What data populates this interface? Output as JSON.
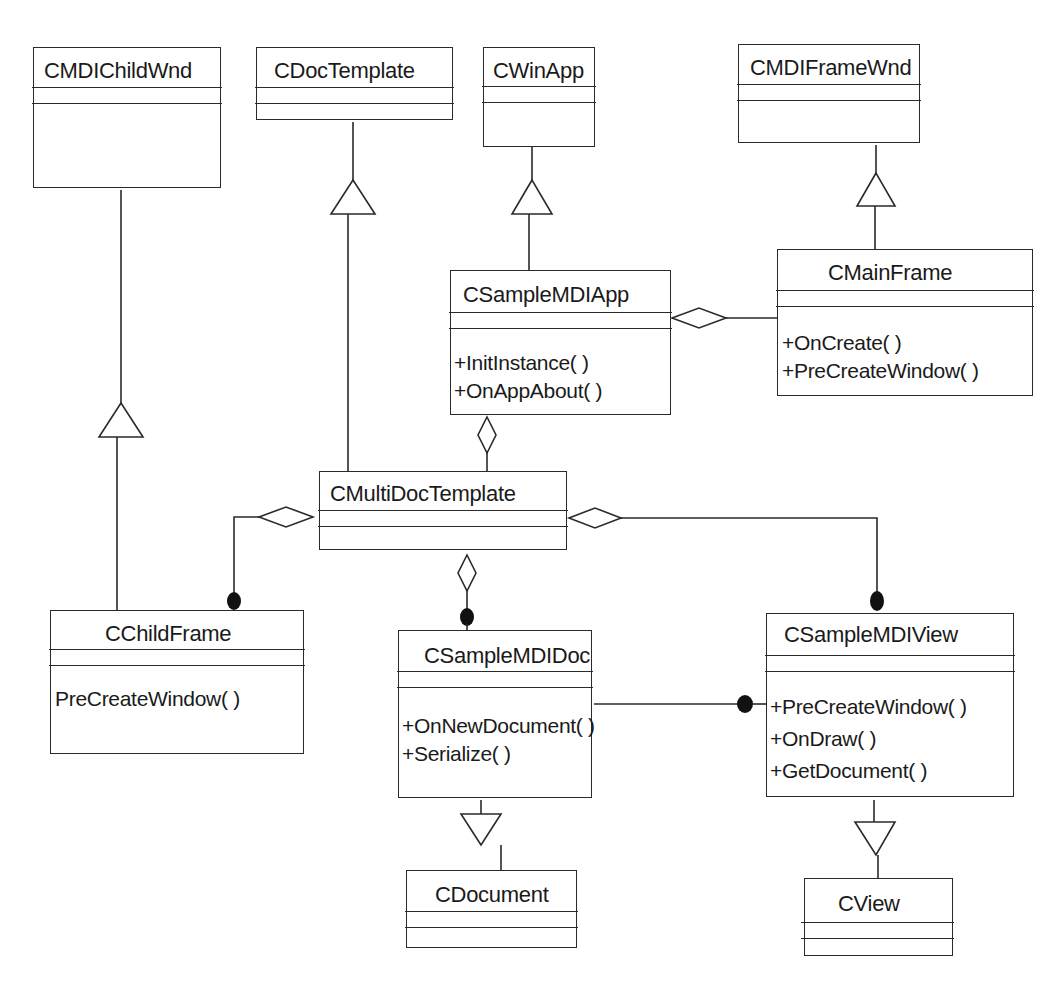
{
  "diagram": {
    "type": "UML class diagram",
    "classes": {
      "cmdichildwnd": {
        "name": "CMDIChildWnd",
        "attributes": [],
        "operations": []
      },
      "cdoctemplate": {
        "name": "CDocTemplate",
        "attributes": [],
        "operations": []
      },
      "cwinapp": {
        "name": "CWinApp",
        "attributes": [],
        "operations": []
      },
      "cmdiframewnd": {
        "name": "CMDIFrameWnd",
        "attributes": [],
        "operations": []
      },
      "cmainframe": {
        "name": "CMainFrame",
        "attributes": [],
        "operations": [
          "+OnCreate( )",
          "+PreCreateWindow( )"
        ]
      },
      "csamplemdiapp": {
        "name": "CSampleMDIApp",
        "attributes": [],
        "operations": [
          "+InitInstance( )",
          "+OnAppAbout( )"
        ]
      },
      "cmultidoctemplate": {
        "name": "CMultiDocTemplate",
        "attributes": [],
        "operations": []
      },
      "cchildframe": {
        "name": "CChildFrame",
        "attributes": [],
        "operations": [
          "PreCreateWindow( )"
        ]
      },
      "csamplemdidoc": {
        "name": "CSampleMDIDoc",
        "attributes": [],
        "operations": [
          "+OnNewDocument( )",
          "+Serialize( )"
        ]
      },
      "csamplemdiview": {
        "name": "CSampleMDIView",
        "attributes": [],
        "operations": [
          "+PreCreateWindow( )",
          "+OnDraw( )",
          "+GetDocument( )"
        ]
      },
      "cdocument": {
        "name": "CDocument",
        "attributes": [],
        "operations": []
      },
      "cview": {
        "name": "CView",
        "attributes": [],
        "operations": []
      }
    },
    "relationships": [
      {
        "type": "generalization",
        "from": "CChildFrame",
        "to": "CMDIChildWnd"
      },
      {
        "type": "generalization",
        "from": "CMultiDocTemplate",
        "to": "CDocTemplate"
      },
      {
        "type": "generalization",
        "from": "CSampleMDIApp",
        "to": "CWinApp"
      },
      {
        "type": "generalization",
        "from": "CMainFrame",
        "to": "CMDIFrameWnd"
      },
      {
        "type": "generalization",
        "from": "CSampleMDIDoc",
        "to": "CDocument"
      },
      {
        "type": "generalization",
        "from": "CSampleMDIView",
        "to": "CView"
      },
      {
        "type": "aggregation",
        "whole": "CSampleMDIApp",
        "part": "CMainFrame"
      },
      {
        "type": "aggregation",
        "whole": "CSampleMDIApp",
        "part": "CMultiDocTemplate"
      },
      {
        "type": "aggregation",
        "whole": "CMultiDocTemplate",
        "part": "CChildFrame",
        "part_end": "filled-dot"
      },
      {
        "type": "aggregation",
        "whole": "CMultiDocTemplate",
        "part": "CSampleMDIDoc",
        "part_end": "filled-dot"
      },
      {
        "type": "aggregation",
        "whole": "CMultiDocTemplate",
        "part": "CSampleMDIView",
        "part_end": "filled-dot"
      },
      {
        "type": "association",
        "from": "CSampleMDIDoc",
        "to": "CSampleMDIView",
        "to_end": "filled-dot"
      }
    ],
    "colors": {
      "line": "#2a2a2a",
      "background": "#ffffff",
      "text": "#1a1a1a"
    }
  }
}
